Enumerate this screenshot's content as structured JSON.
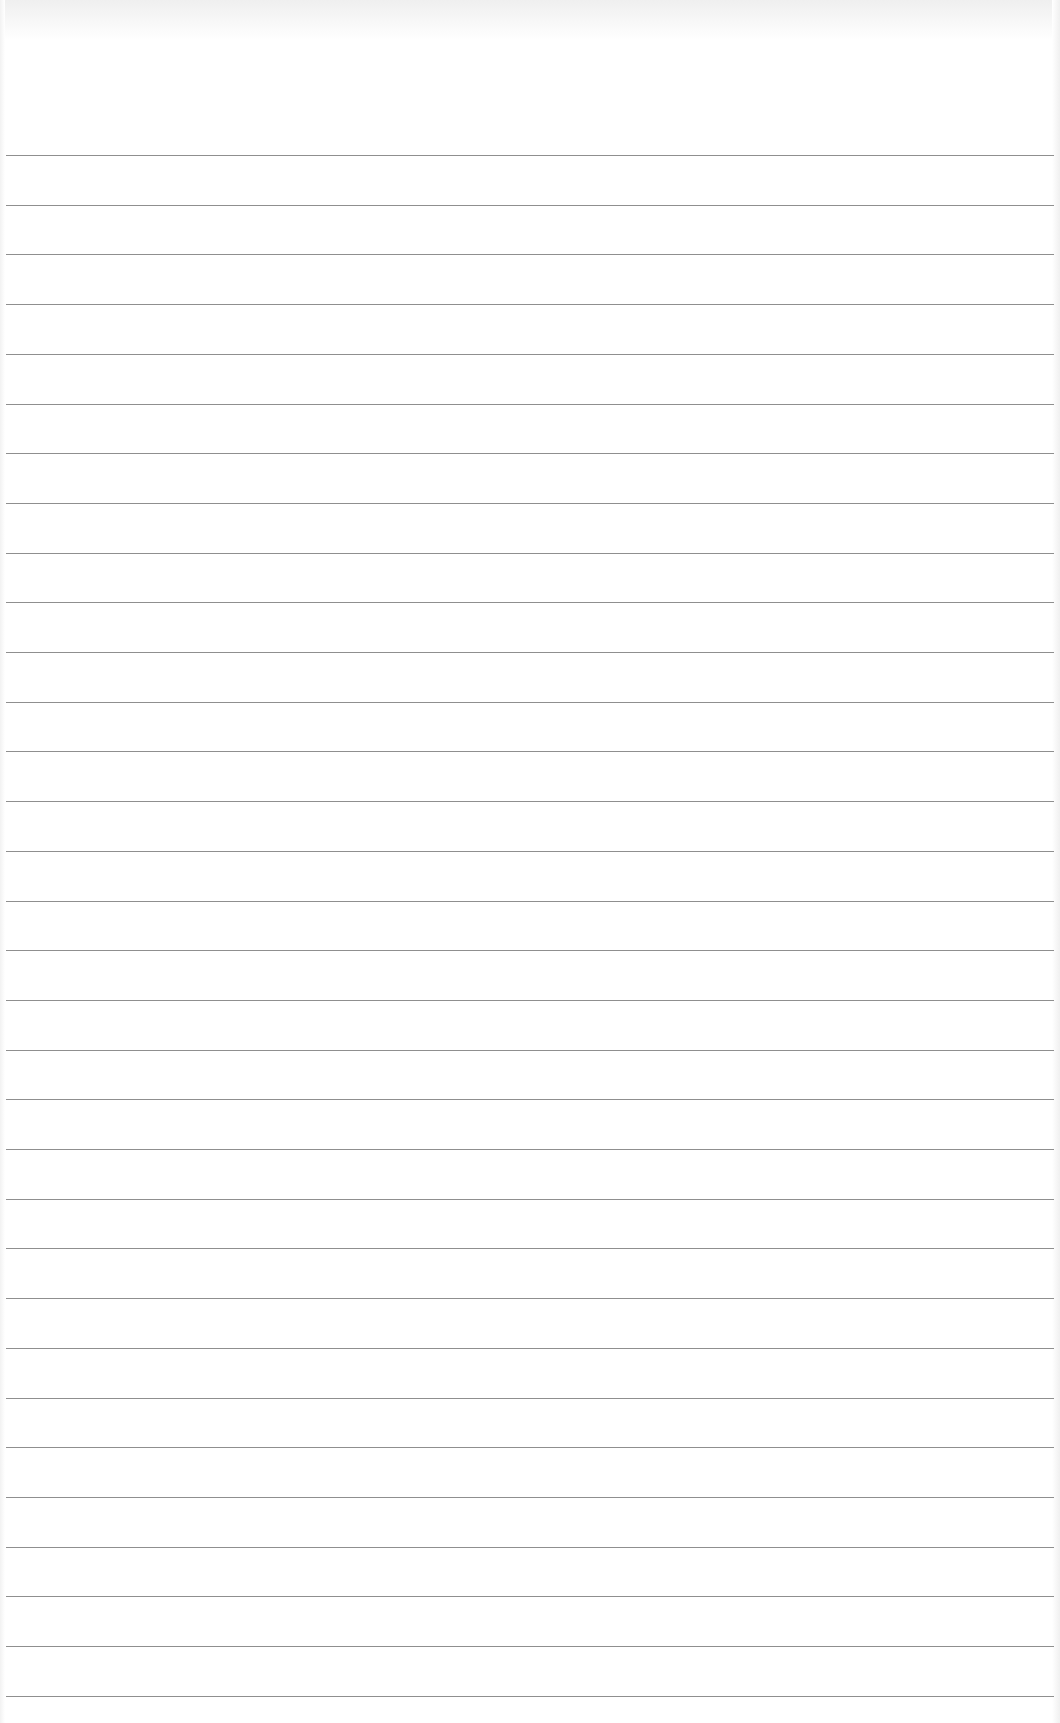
{
  "page": {
    "type": "ruled-paper",
    "background_color": "#ffffff",
    "line_color": "#8f8f8f",
    "line_count": 32,
    "first_line_y": 155,
    "line_spacing": 49.7
  }
}
